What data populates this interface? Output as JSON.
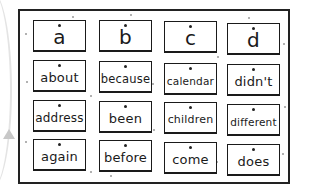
{
  "board": {
    "rows": [
      [
        "a",
        "b",
        "c",
        "d"
      ],
      [
        "about",
        "because",
        "calendar",
        "didn't"
      ],
      [
        "address",
        "been",
        "children",
        "different"
      ],
      [
        "again",
        "before",
        "come",
        "does"
      ]
    ]
  }
}
